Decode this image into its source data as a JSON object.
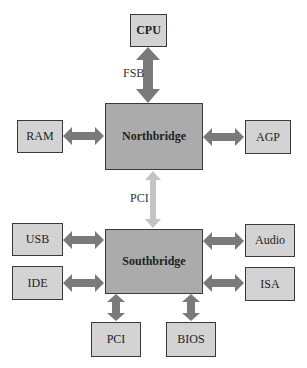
{
  "diagram": {
    "colors": {
      "box_fill": "#d3d3d3",
      "bridge_fill": "#ababab",
      "border": "#3a3a3a",
      "arrow": "#7a7a7a",
      "pci_arrow": "#c4c4c4"
    },
    "nodes": {
      "cpu": "CPU",
      "northbridge": "Northbridge",
      "southbridge": "Southbridge",
      "ram": "RAM",
      "agp": "AGP",
      "usb": "USB",
      "ide": "IDE",
      "audio": "Audio",
      "isa": "ISA",
      "pci": "PCI",
      "bios": "BIOS"
    },
    "edge_labels": {
      "fsb": "FSB",
      "pci_bus": "PCI"
    },
    "edges": [
      {
        "from": "CPU",
        "to": "Northbridge",
        "label": "FSB"
      },
      {
        "from": "RAM",
        "to": "Northbridge"
      },
      {
        "from": "AGP",
        "to": "Northbridge"
      },
      {
        "from": "Northbridge",
        "to": "Southbridge",
        "label": "PCI"
      },
      {
        "from": "USB",
        "to": "Southbridge"
      },
      {
        "from": "IDE",
        "to": "Southbridge"
      },
      {
        "from": "Audio",
        "to": "Southbridge"
      },
      {
        "from": "ISA",
        "to": "Southbridge"
      },
      {
        "from": "PCI",
        "to": "Southbridge"
      },
      {
        "from": "BIOS",
        "to": "Southbridge"
      }
    ]
  }
}
